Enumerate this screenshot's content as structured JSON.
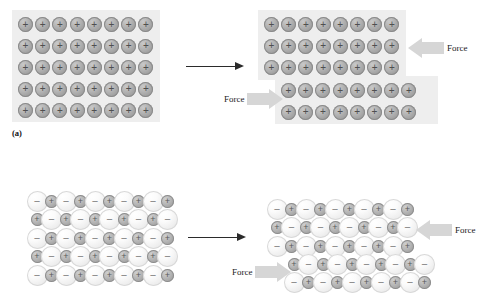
{
  "figure": {
    "panels": [
      {
        "id": "a",
        "caption": "(a)",
        "bonding_type": "metallic",
        "before": {
          "rows": 5,
          "cols": 8,
          "charges": [
            [
              "+",
              "+",
              "+",
              "+",
              "+",
              "+",
              "+",
              "+"
            ],
            [
              "+",
              "+",
              "+",
              "+",
              "+",
              "+",
              "+",
              "+"
            ],
            [
              "+",
              "+",
              "+",
              "+",
              "+",
              "+",
              "+",
              "+"
            ],
            [
              "+",
              "+",
              "+",
              "+",
              "+",
              "+",
              "+",
              "+"
            ],
            [
              "+",
              "+",
              "+",
              "+",
              "+",
              "+",
              "+",
              "+"
            ]
          ]
        },
        "after": {
          "upper_block": {
            "rows": 3,
            "cols": 8,
            "charges": [
              [
                "+",
                "+",
                "+",
                "+",
                "+",
                "+",
                "+",
                "+"
              ],
              [
                "+",
                "+",
                "+",
                "+",
                "+",
                "+",
                "+",
                "+"
              ],
              [
                "+",
                "+",
                "+",
                "+",
                "+",
                "+",
                "+",
                "+"
              ]
            ]
          },
          "lower_block": {
            "rows": 2,
            "cols": 8,
            "charges": [
              [
                "+",
                "+",
                "+",
                "+",
                "+",
                "+",
                "+",
                "+"
              ],
              [
                "+",
                "+",
                "+",
                "+",
                "+",
                "+",
                "+",
                "+"
              ]
            ]
          }
        },
        "force_labels": {
          "upper_right": "Force",
          "lower_left": "Force"
        }
      },
      {
        "id": "b",
        "caption": "",
        "bonding_type": "ionic",
        "before": {
          "rows": 5,
          "cols": 10,
          "charges": [
            [
              "-",
              "+",
              "-",
              "+",
              "-",
              "+",
              "-",
              "+",
              "-",
              "+"
            ],
            [
              "+",
              "-",
              "+",
              "-",
              "+",
              "-",
              "+",
              "-",
              "+",
              "-"
            ],
            [
              "-",
              "+",
              "-",
              "+",
              "-",
              "+",
              "-",
              "+",
              "-",
              "+"
            ],
            [
              "+",
              "-",
              "+",
              "-",
              "+",
              "-",
              "+",
              "-",
              "+",
              "-"
            ],
            [
              "-",
              "+",
              "-",
              "+",
              "-",
              "+",
              "-",
              "+",
              "-",
              "+"
            ]
          ]
        },
        "after": {
          "upper_block": {
            "rows": 3,
            "cols": 10,
            "charges": [
              [
                "-",
                "+",
                "-",
                "+",
                "-",
                "+",
                "-",
                "+",
                "-",
                "+"
              ],
              [
                "+",
                "-",
                "+",
                "-",
                "+",
                "-",
                "+",
                "-",
                "+",
                "-"
              ],
              [
                "-",
                "+",
                "-",
                "+",
                "-",
                "+",
                "-",
                "+",
                "-",
                "+"
              ]
            ]
          },
          "lower_block": {
            "rows": 2,
            "cols": 10,
            "charges": [
              [
                "+",
                "-",
                "+",
                "-",
                "+",
                "-",
                "+",
                "-",
                "+",
                "-"
              ],
              [
                "-",
                "+",
                "-",
                "+",
                "-",
                "+",
                "-",
                "+",
                "-",
                "+"
              ]
            ]
          }
        },
        "force_labels": {
          "upper_right": "Force",
          "lower_left": "Force"
        }
      }
    ],
    "colors": {
      "panel_background": "#eeeeee",
      "cation_fill": "#b3b3b3",
      "anion_fill": "#f4f4f4",
      "force_arrow_fill": "#d6d6d6",
      "transition_arrow": "#2b2b2b",
      "page_background": "#ffffff"
    },
    "glyphs": {
      "positive": "+",
      "negative": "−"
    }
  }
}
